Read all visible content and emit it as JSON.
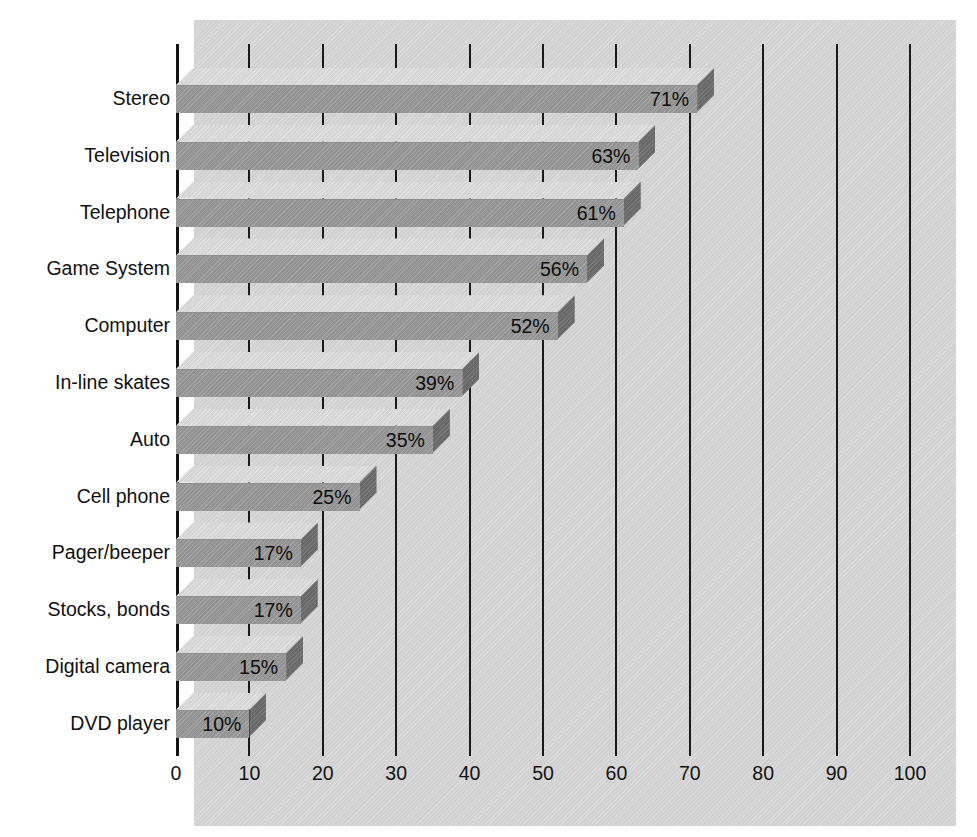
{
  "chart_data": {
    "type": "bar",
    "orientation": "horizontal",
    "title": "",
    "subtitle": "",
    "xlabel": "",
    "ylabel": "",
    "xlim": [
      0,
      100
    ],
    "grid": true,
    "legend": null,
    "x_ticks": [
      0,
      10,
      20,
      30,
      40,
      50,
      60,
      70,
      80,
      90,
      100
    ],
    "x_tick_labels": [
      "0",
      "10",
      "20",
      "30",
      "40",
      "50",
      "60",
      "70",
      "80",
      "90",
      "100"
    ],
    "categories": [
      "Stereo",
      "Television",
      "Telephone",
      "Game System",
      "Computer",
      "In-line skates",
      "Auto",
      "Cell phone",
      "Pager/beeper",
      "Stocks, bonds",
      "Digital camera",
      "DVD player"
    ],
    "values": [
      71,
      63,
      61,
      56,
      52,
      39,
      35,
      25,
      17,
      17,
      15,
      10
    ],
    "value_labels": [
      "71%",
      "63%",
      "61%",
      "56%",
      "52%",
      "39%",
      "35%",
      "25%",
      "17%",
      "17%",
      "15%",
      "10%"
    ]
  },
  "style": {
    "panel_color": "#d4d4d4",
    "bar_front_color": "#9a9a9a",
    "bar_top_color": "#dcdcdc",
    "bar_side_color": "#6f6f6f",
    "axis_color": "#141414",
    "text_color": "#111111"
  }
}
